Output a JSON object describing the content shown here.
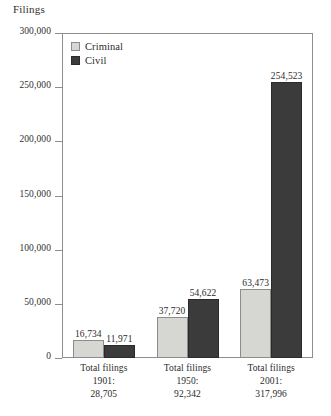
{
  "chart_data": {
    "type": "bar",
    "title": "",
    "ylabel": "Filings",
    "xlabel": "",
    "ylim": [
      0,
      300000
    ],
    "yticks": [
      "0",
      "50,000",
      "100,000",
      "150,000",
      "200,000",
      "250,000",
      "300,000"
    ],
    "ytick_values": [
      0,
      50000,
      100000,
      150000,
      200000,
      250000,
      300000
    ],
    "grid": false,
    "legend_position": "top-left",
    "categories": [
      "1901",
      "1950",
      "2001"
    ],
    "category_labels": [
      {
        "line1": "Total filings",
        "line2": "1901:",
        "line3": "28,705"
      },
      {
        "line1": "Total filings",
        "line2": "1950:",
        "line3": "92,342"
      },
      {
        "line1": "Total filings",
        "line2": "2001:",
        "line3": "317,996"
      }
    ],
    "series": [
      {
        "name": "Criminal",
        "color": "#d6d6d3",
        "values": [
          16734,
          37720,
          63473
        ],
        "labels": [
          "16,734",
          "37,720",
          "63,473"
        ]
      },
      {
        "name": "Civil",
        "color": "#3b3b3b",
        "values": [
          11971,
          54622,
          254523
        ],
        "labels": [
          "11,971",
          "54,622",
          "254,523"
        ]
      }
    ],
    "totals": [
      28705,
      92342,
      317996
    ]
  },
  "axis": {
    "y_title": "Filings"
  },
  "legend": {
    "items": [
      {
        "label": "Criminal",
        "swatch": "criminal-swatch"
      },
      {
        "label": "Civil",
        "swatch": "civil-swatch"
      }
    ]
  }
}
